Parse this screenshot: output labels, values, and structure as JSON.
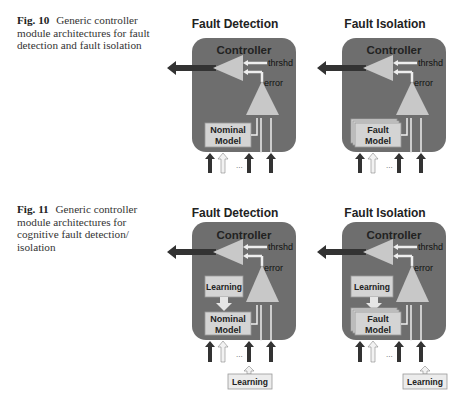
{
  "figures": [
    {
      "id": "fig10",
      "caption": {
        "number": "Fig. 10",
        "text": "Generic controller module architectures for fault detection and fault isolation"
      },
      "diagrams": [
        {
          "title": "Fault Detection",
          "controller_label": "Controller",
          "threshold_label": "thrshd",
          "error_label": "error",
          "model_label_line1": "Nominal",
          "model_label_line2": "Model",
          "model_stacked": false,
          "inputs_ellipsis": "...",
          "has_learning": false
        },
        {
          "title": "Fault Isolation",
          "controller_label": "Controller",
          "threshold_label": "thrshd",
          "error_label": "error",
          "model_label_line1": "Fault",
          "model_label_line2": "Model",
          "model_stacked": true,
          "inputs_ellipsis": "...",
          "has_learning": false
        }
      ]
    },
    {
      "id": "fig11",
      "caption": {
        "number": "Fig. 11",
        "text": "Generic controller module architectures for cognitive fault detection/ isolation"
      },
      "diagrams": [
        {
          "title": "Fault Detection",
          "controller_label": "Controller",
          "threshold_label": "thrshd",
          "error_label": "error",
          "model_label_line1": "Nominal",
          "model_label_line2": "Model",
          "model_stacked": false,
          "inputs_ellipsis": "...",
          "has_learning": true,
          "inner_learning_label": "Learning",
          "outer_learning_label": "Learning"
        },
        {
          "title": "Fault Isolation",
          "controller_label": "Controller",
          "threshold_label": "thrshd",
          "error_label": "error",
          "model_label_line1": "Fault",
          "model_label_line2": "Model",
          "model_stacked": true,
          "inputs_ellipsis": "...",
          "has_learning": true,
          "inner_learning_label": "Learning",
          "outer_learning_label": "Learning"
        }
      ]
    }
  ],
  "colors": {
    "controller_fill": "#6e6e6e",
    "triangle_fill": "#c8c8c8",
    "box_fill": "#d4d4d4",
    "arrow_dark": "#333333",
    "arrow_light": "#f2f2f2"
  }
}
